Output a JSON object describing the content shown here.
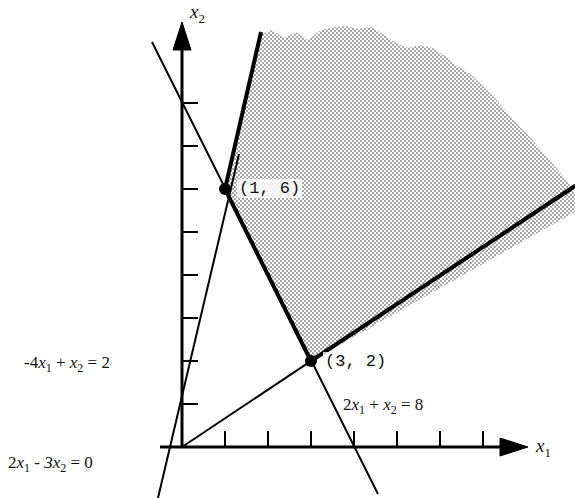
{
  "figure": {
    "axes": {
      "x_label": "x",
      "x_sub": "1",
      "y_label": "x",
      "y_sub": "2",
      "origin_px": [
        182,
        447
      ],
      "unit_px": 43,
      "x_ticks": [
        1,
        2,
        3,
        4,
        5,
        6,
        7
      ],
      "y_ticks": [
        1,
        2,
        3,
        4,
        5,
        6,
        7,
        8
      ]
    },
    "constraints": [
      {
        "id": "c1",
        "text_parts": {
          "lead": "2",
          "v1": "x",
          "s1": "1",
          "op": "+",
          "v2": "x",
          "s2": "2",
          "eq": "= 8"
        },
        "full_text": "2x1 + x2 = 8",
        "label_pos_px": [
          343,
          397
        ]
      },
      {
        "id": "c2",
        "text_parts": {
          "lead": "-4",
          "v1": "x",
          "s1": "1",
          "op": "+",
          "v2": "x",
          "s2": "2",
          "eq": "= 2"
        },
        "full_text": "-4x1 + x2 = 2",
        "label_pos_px": [
          28,
          355
        ]
      },
      {
        "id": "c3",
        "text_parts": {
          "lead": "2",
          "v1": "x",
          "s1": "1",
          "op": "-",
          "v2": "3x",
          "s2": "2",
          "eq": "= 0"
        },
        "full_text": "2x1 - 3x2 = 0",
        "label_pos_px": [
          10,
          455
        ]
      }
    ],
    "vertices": [
      {
        "label": "(1,  6)",
        "x": 1,
        "y": 6,
        "dot_px": [
          225,
          189
        ],
        "label_pos_px": [
          237,
          179
        ]
      },
      {
        "label": "(3,  2)",
        "x": 3,
        "y": 2,
        "dot_px": [
          311,
          361
        ],
        "label_pos_px": [
          323,
          352
        ]
      }
    ],
    "region": {
      "fill_color": "#c9c9c9",
      "boundary_color": "#000000",
      "unbounded": true,
      "description": "shaded feasible region, unbounded above and to the right"
    }
  }
}
